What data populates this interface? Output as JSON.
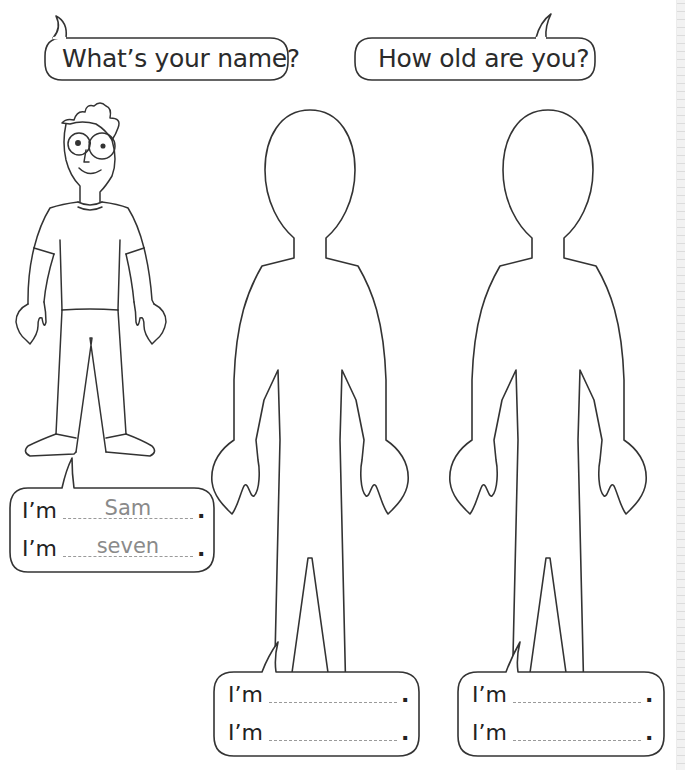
{
  "worksheet": {
    "questions": [
      {
        "id": "name",
        "text": "What’s your name?"
      },
      {
        "id": "age",
        "text": "How old are you?"
      }
    ],
    "example": {
      "character": "boy-with-glasses",
      "lines": [
        {
          "prefix": "I’m",
          "answer": "Sam",
          "suffix": "."
        },
        {
          "prefix": "I’m",
          "answer": "seven",
          "suffix": "."
        }
      ]
    },
    "blank_figures": [
      {
        "id": "figure-1",
        "lines": [
          {
            "prefix": "I’m",
            "answer": "",
            "suffix": "."
          },
          {
            "prefix": "I’m",
            "answer": "",
            "suffix": "."
          }
        ]
      },
      {
        "id": "figure-2",
        "lines": [
          {
            "prefix": "I’m",
            "answer": "",
            "suffix": "."
          },
          {
            "prefix": "I’m",
            "answer": "",
            "suffix": "."
          }
        ]
      }
    ],
    "colors": {
      "outline": "#333333",
      "answer_text": "#8a8a8a",
      "dashed_line": "#9a9a9a"
    }
  }
}
